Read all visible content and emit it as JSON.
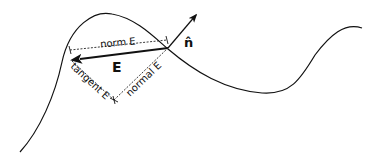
{
  "diagram": {
    "labels": {
      "norm": "norm E",
      "tangent": "tangent E",
      "normal": "normal E",
      "vector": "E",
      "unit_normal": "n̂"
    },
    "colors": {
      "stroke": "#111111",
      "background": "#ffffff"
    }
  }
}
